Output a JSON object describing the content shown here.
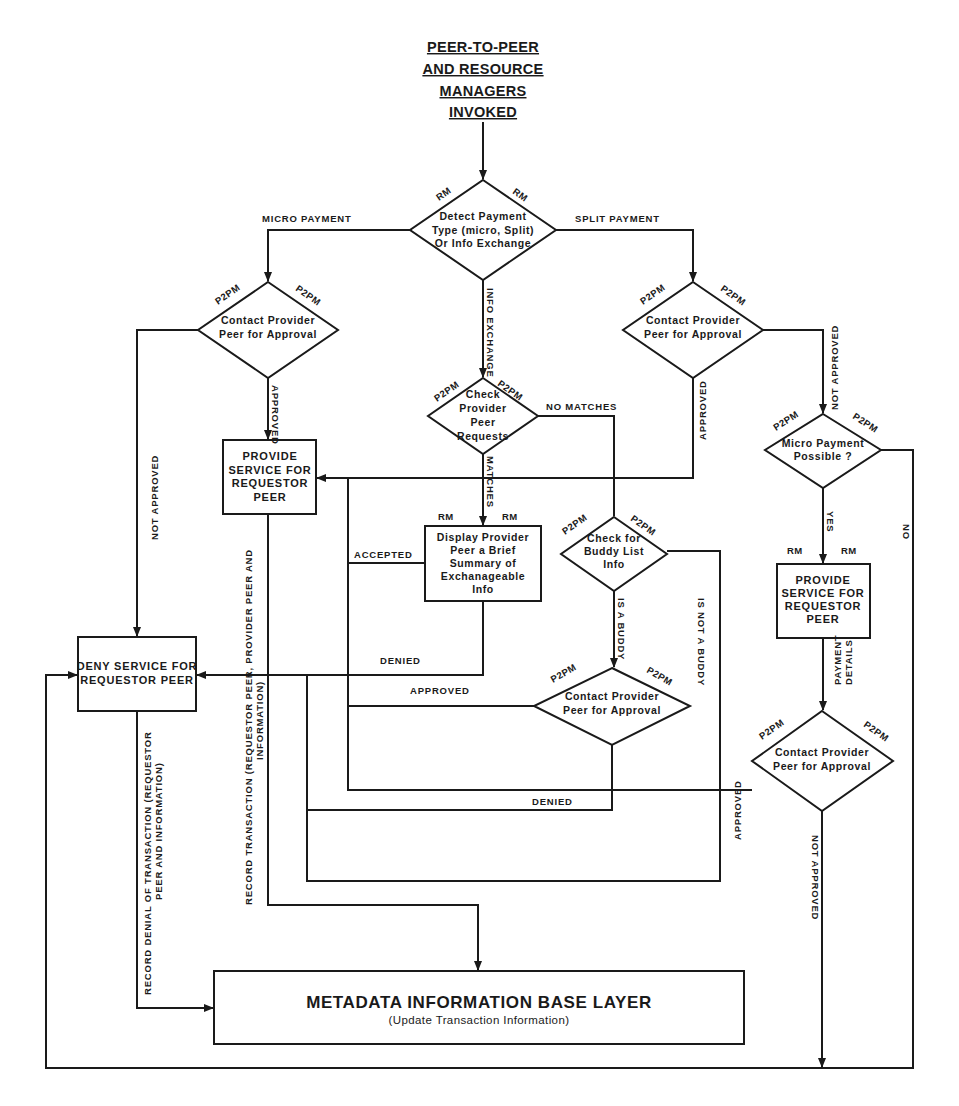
{
  "title": {
    "lines": [
      "PEER-TO-PEER",
      "AND RESOURCE",
      "MANAGERS",
      "INVOKED"
    ]
  },
  "colors": {
    "stroke": "#1a1a1a",
    "background": "#ffffff"
  },
  "nodes": {
    "detect": {
      "type": "decision",
      "tags": [
        "RM",
        "RM"
      ],
      "lines": [
        "Detect Payment",
        "Type (micro, Split)",
        "Or Info Exchange"
      ]
    },
    "micro_contact": {
      "type": "decision",
      "tags": [
        "P2PM",
        "P2PM"
      ],
      "lines": [
        "Contact Provider",
        "Peer for Approval"
      ]
    },
    "split_contact": {
      "type": "decision",
      "tags": [
        "P2PM",
        "P2PM"
      ],
      "lines": [
        "Contact Provider",
        "Peer for Approval"
      ]
    },
    "check_requests": {
      "type": "decision",
      "tags": [
        "P2PM",
        "P2PM"
      ],
      "lines": [
        "Check",
        "Provider",
        "Peer",
        "Requests"
      ]
    },
    "provide_service_left": {
      "type": "process",
      "lines": [
        "PROVIDE",
        "SERVICE FOR",
        "REQUESTOR",
        "PEER"
      ]
    },
    "display_summary": {
      "type": "process",
      "tags": [
        "RM",
        "RM"
      ],
      "lines": [
        "Display Provider",
        "Peer a Brief",
        "Summary of",
        "Exchanageable",
        "Info"
      ]
    },
    "buddy_check": {
      "type": "decision",
      "tags": [
        "P2PM",
        "P2PM"
      ],
      "lines": [
        "Check for",
        "Buddy List",
        "Info"
      ]
    },
    "buddy_contact": {
      "type": "decision",
      "tags": [
        "P2PM",
        "P2PM"
      ],
      "lines": [
        "Contact Provider",
        "Peer for Approval"
      ]
    },
    "micro_possible": {
      "type": "decision",
      "tags": [
        "P2PM",
        "P2PM"
      ],
      "lines": [
        "Micro Payment",
        "Possible ?"
      ]
    },
    "provide_service_right": {
      "type": "process",
      "tags": [
        "RM",
        "RM"
      ],
      "lines": [
        "PROVIDE",
        "SERVICE FOR",
        "REQUESTOR",
        "PEER"
      ]
    },
    "payment_contact": {
      "type": "decision",
      "tags": [
        "P2PM",
        "P2PM"
      ],
      "lines": [
        "Contact Provider",
        "Peer for Approval"
      ]
    },
    "deny_service": {
      "type": "process",
      "lines": [
        "DENY SERVICE FOR",
        "REQUESTOR PEER"
      ]
    },
    "metadata": {
      "type": "process",
      "lines": [
        "METADATA INFORMATION BASE LAYER",
        "(Update Transaction Information)"
      ]
    }
  },
  "edge_labels": {
    "micro_payment": "MICRO PAYMENT",
    "split_payment": "SPLIT PAYMENT",
    "info_exchange": "INFO EXCHANGE",
    "micro_approved": "APPROVED",
    "micro_not_approved": "NOT APPROVED",
    "split_approved": "APPROVED",
    "split_not_approved": "NOT APPROVED",
    "no_matches": "NO MATCHES",
    "matches": "MATCHES",
    "accepted": "ACCEPTED",
    "denied_display": "DENIED",
    "is_a_buddy": "IS A BUDDY",
    "is_not_a_buddy": "IS NOT A BUDDY",
    "buddy_approved": "APPROVED",
    "buddy_denied": "DENIED",
    "yes": "YES",
    "no": "NO",
    "payment_details": [
      "PAYMENT",
      "DETAILS"
    ],
    "payment_approved": "APPROVED",
    "payment_not_approved": "NOT APPROVED",
    "record_transaction": [
      "RECORD TRANSACTION (REQUESTOR PEER, PROVIDER PEER AND",
      "INFORMATION)"
    ],
    "record_denial": [
      "RECORD DENIAL OF TRANSACTION (REQUESTOR",
      "PEER AND INFORMATION)"
    ]
  }
}
